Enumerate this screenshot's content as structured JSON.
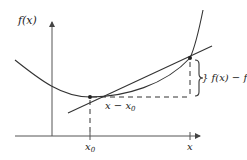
{
  "diagram": {
    "title": "",
    "axes": {
      "y_label": "f(x)",
      "x_tick_labels": [
        "x0",
        "x"
      ]
    },
    "labels": {
      "y_axis": "f(x)",
      "tick_x0_main": "x",
      "tick_x0_sub": "0",
      "tick_x": "x",
      "horizontal_diff_main": "x − x",
      "horizontal_diff_sub": "0",
      "vertical_diff_main": "} f(x) − f(x",
      "vertical_diff_sub": "0",
      "vertical_diff_close": ")"
    },
    "elements": [
      {
        "type": "curve",
        "description": "convex function f(x)"
      },
      {
        "type": "line",
        "description": "secant line through (x0, f(x0)) and (x, f(x))"
      },
      {
        "type": "point",
        "label": "(x0, f(x0))"
      },
      {
        "type": "point",
        "label": "(x, f(x))"
      },
      {
        "type": "dashed-segment",
        "description": "horizontal run x − x0"
      },
      {
        "type": "dashed-segment",
        "description": "vertical rise f(x) − f(x0)"
      },
      {
        "type": "brace",
        "description": "brace marking f(x) − f(x0)"
      }
    ],
    "colors": {
      "ink": "#333333",
      "background": "#ffffff"
    }
  }
}
